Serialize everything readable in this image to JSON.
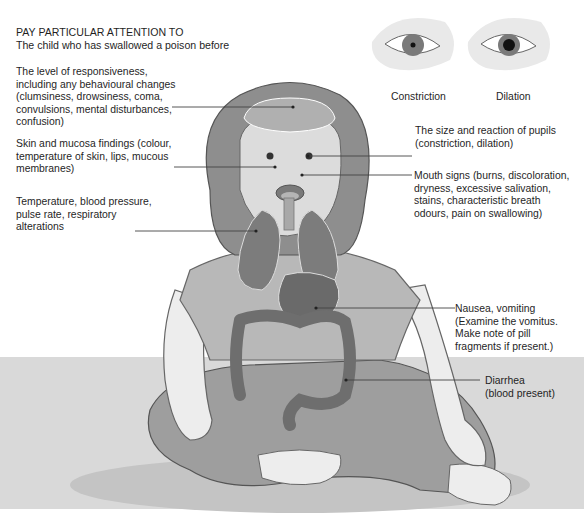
{
  "heading": {
    "title": "PAY PARTICULAR ATTENTION TO",
    "subtitle": "The child who has swallowed a poison before"
  },
  "pupils": {
    "left_label": "Constriction",
    "right_label": "Dilation"
  },
  "labels_left": [
    {
      "id": "responsiveness",
      "text": "The level of responsiveness,\nincluding any behavioural changes\n(clumsiness, drowsiness, coma,\nconvulsions, mental disturbances,\nconfusion)"
    },
    {
      "id": "skin",
      "text": "Skin and mucosa findings (colour,\ntemperature of skin, lips, mucous\nmembranes)"
    },
    {
      "id": "vitals",
      "text": "Temperature, blood pressure,\npulse rate, respiratory\nalterations"
    }
  ],
  "labels_right": [
    {
      "id": "pupils",
      "text": "The size and reaction of pupils\n(constriction, dilation)"
    },
    {
      "id": "mouth",
      "text": "Mouth signs (burns, discoloration,\ndryness, excessive salivation,\nstains, characteristic breath\nodours, pain on swallowing)"
    },
    {
      "id": "nausea",
      "text": "Nausea, vomiting\n(Examine the vomitus.\nMake note of pill\nfragments if present.)"
    },
    {
      "id": "diarrhea",
      "text": "Diarrhea\n(blood present)"
    }
  ]
}
